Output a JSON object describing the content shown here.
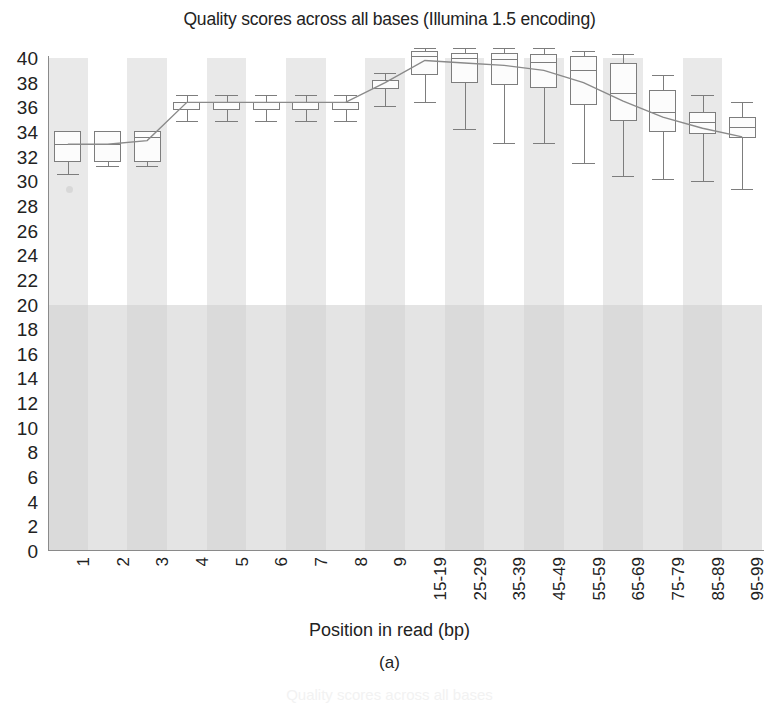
{
  "chart_data": {
    "type": "box",
    "title": "Quality scores across all bases (Illumina 1.5 encoding)",
    "xlabel": "Position in read (bp)",
    "ylabel": "",
    "panel_label": "(a)",
    "ghost_caption": "Quality scores across all bases",
    "ylim": [
      0,
      40
    ],
    "ytick_step": 2,
    "yticks": [
      40,
      38,
      36,
      34,
      32,
      30,
      28,
      26,
      24,
      22,
      20,
      18,
      16,
      14,
      12,
      10,
      8,
      6,
      4,
      2,
      0
    ],
    "categories": [
      "1",
      "2",
      "3",
      "4",
      "5",
      "6",
      "7",
      "8",
      "9",
      "15-19",
      "25-29",
      "35-39",
      "45-49",
      "55-59",
      "65-69",
      "75-79",
      "85-89",
      "95-99"
    ],
    "grid": false,
    "legend": "none",
    "background_bands": true,
    "good_quality_threshold": 20,
    "boxes": [
      {
        "x": "1",
        "whisker_low": 30.6,
        "q1": 31.6,
        "median": 33.0,
        "q3": 34.1,
        "whisker_high": 34.1,
        "mean": 33.0
      },
      {
        "x": "2",
        "whisker_low": 31.2,
        "q1": 31.6,
        "median": 33.0,
        "q3": 34.1,
        "whisker_high": 34.1,
        "mean": 33.0
      },
      {
        "x": "3",
        "whisker_low": 31.2,
        "q1": 31.6,
        "median": 33.6,
        "q3": 34.1,
        "whisker_high": 34.1,
        "mean": 33.3
      },
      {
        "x": "4",
        "whisker_low": 34.9,
        "q1": 35.8,
        "median": 36.4,
        "q3": 36.4,
        "whisker_high": 37.0,
        "mean": 36.4
      },
      {
        "x": "5",
        "whisker_low": 34.9,
        "q1": 35.8,
        "median": 36.4,
        "q3": 36.4,
        "whisker_high": 37.0,
        "mean": 36.4
      },
      {
        "x": "6",
        "whisker_low": 34.9,
        "q1": 35.8,
        "median": 36.4,
        "q3": 36.4,
        "whisker_high": 37.0,
        "mean": 36.4
      },
      {
        "x": "7",
        "whisker_low": 34.9,
        "q1": 35.8,
        "median": 36.4,
        "q3": 36.4,
        "whisker_high": 37.0,
        "mean": 36.4
      },
      {
        "x": "8",
        "whisker_low": 34.9,
        "q1": 35.8,
        "median": 36.4,
        "q3": 36.4,
        "whisker_high": 37.0,
        "mean": 36.4
      },
      {
        "x": "9",
        "whisker_low": 36.1,
        "q1": 37.5,
        "median": 38.2,
        "q3": 38.2,
        "whisker_high": 38.8,
        "mean": 38.0
      },
      {
        "x": "15-19",
        "whisker_low": 36.4,
        "q1": 38.6,
        "median": 40.2,
        "q3": 40.6,
        "whisker_high": 40.8,
        "mean": 39.8
      },
      {
        "x": "25-29",
        "whisker_low": 34.2,
        "q1": 38.0,
        "median": 40.0,
        "q3": 40.4,
        "whisker_high": 40.8,
        "mean": 39.6
      },
      {
        "x": "35-39",
        "whisker_low": 33.1,
        "q1": 37.8,
        "median": 39.9,
        "q3": 40.4,
        "whisker_high": 40.8,
        "mean": 39.4
      },
      {
        "x": "45-49",
        "whisker_low": 33.1,
        "q1": 37.6,
        "median": 39.7,
        "q3": 40.3,
        "whisker_high": 40.8,
        "mean": 39.0
      },
      {
        "x": "55-59",
        "whisker_low": 31.5,
        "q1": 36.2,
        "median": 39.0,
        "q3": 40.2,
        "whisker_high": 40.6,
        "mean": 38.0
      },
      {
        "x": "65-69",
        "whisker_low": 30.4,
        "q1": 34.9,
        "median": 37.2,
        "q3": 39.6,
        "whisker_high": 40.3,
        "mean": 36.5
      },
      {
        "x": "75-79",
        "whisker_low": 30.2,
        "q1": 34.0,
        "median": 35.6,
        "q3": 37.4,
        "whisker_high": 38.6,
        "mean": 35.2
      },
      {
        "x": "85-89",
        "whisker_low": 30.0,
        "q1": 33.8,
        "median": 34.8,
        "q3": 35.6,
        "whisker_high": 37.0,
        "mean": 34.3
      },
      {
        "x": "95-99",
        "whisker_low": 29.4,
        "q1": 33.5,
        "median": 34.4,
        "q3": 35.2,
        "whisker_high": 36.4,
        "mean": 33.6
      }
    ],
    "colors": {
      "box_stroke": "#7d7d7d",
      "box_fill": "#fcfcfc",
      "band": "#e9e9e9",
      "low_region": "#cdcdcd",
      "mean_line": "#8a8a8a",
      "axis": "#8a8a8a",
      "text": "#222222"
    }
  }
}
